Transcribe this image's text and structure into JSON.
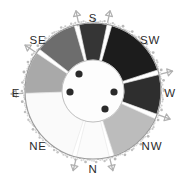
{
  "figure": {
    "background_color": "#ffffff",
    "center": {
      "x": 93,
      "y": 91
    },
    "outer_radius": 68,
    "ring_inner_radius": 31,
    "hub_radius": 31,
    "hub_color": "#fdfdfd",
    "hub_stroke": "#b9b9b9",
    "outline_color": "#9a9a9a",
    "stipple_color": "#a9a9a9",
    "arrow_color": "#b0b0b0"
  },
  "labels": [
    {
      "name": "S",
      "text": "S",
      "x": 93,
      "y": 19,
      "angle_deg": 90
    },
    {
      "name": "SE",
      "text": "SE",
      "x": 38,
      "y": 41,
      "angle_deg": 135
    },
    {
      "name": "SW",
      "text": "SW",
      "x": 150,
      "y": 41,
      "angle_deg": 45
    },
    {
      "name": "E",
      "text": "E",
      "x": 16,
      "y": 94,
      "angle_deg": 180
    },
    {
      "name": "W",
      "text": "W",
      "x": 170,
      "y": 94,
      "angle_deg": 0
    },
    {
      "name": "NE",
      "text": "NE",
      "x": 38,
      "y": 147,
      "angle_deg": 225
    },
    {
      "name": "NW",
      "text": "NW",
      "x": 152,
      "y": 147,
      "angle_deg": 315
    },
    {
      "name": "N",
      "text": "N",
      "x": 93,
      "y": 170,
      "angle_deg": 270
    }
  ],
  "chart_data": {
    "type": "pie",
    "xlabel": "",
    "ylabel": "",
    "legend": "none",
    "grid": false,
    "note": "Eight equal-angle sectors of an annulus, each shaded a distinct gray level and labelled with a compass direction.",
    "categories": [
      "S",
      "SW",
      "W",
      "NW",
      "N",
      "NE",
      "E",
      "SE"
    ],
    "values": [
      12.5,
      12.5,
      12.5,
      12.5,
      12.5,
      12.5,
      12.5,
      12.5
    ],
    "sectors": [
      {
        "label": "S",
        "start_deg": 78,
        "end_deg": 102,
        "fill": "#353535",
        "sweep_deg": 24
      },
      {
        "label": "SW",
        "start_deg": 18,
        "end_deg": 74,
        "fill": "#1e1e1e",
        "sweep_deg": 56
      },
      {
        "label": "W",
        "start_deg": -20,
        "end_deg": 14,
        "fill": "#2e2e2e",
        "sweep_deg": 34
      },
      {
        "label": "NW",
        "start_deg": -72,
        "end_deg": -24,
        "fill": "#bcbcbc",
        "sweep_deg": 48
      },
      {
        "label": "N",
        "start_deg": -104,
        "end_deg": -76,
        "fill": "#fbfbfb",
        "sweep_deg": 28
      },
      {
        "label": "NE",
        "start_deg": -178,
        "end_deg": -108,
        "fill": "#fafafa",
        "sweep_deg": 70
      },
      {
        "label": "E",
        "start_deg": 146,
        "end_deg": 182,
        "fill": "#a9a9a9",
        "sweep_deg": 36
      },
      {
        "label": "SE",
        "start_deg": 106,
        "end_deg": 142,
        "fill": "#6d6d6d",
        "sweep_deg": 36
      }
    ],
    "hub_markers": [
      {
        "name": "marker-1",
        "x": 79,
        "y": 74,
        "r": 3.6,
        "color": "#2a2a2a"
      },
      {
        "name": "marker-2",
        "x": 70,
        "y": 92,
        "r": 3.6,
        "color": "#2a2a2a"
      },
      {
        "name": "marker-3",
        "x": 114,
        "y": 92,
        "r": 3.6,
        "color": "#2a2a2a"
      },
      {
        "name": "marker-4",
        "x": 105,
        "y": 109,
        "r": 3.6,
        "color": "#2a2a2a"
      }
    ],
    "boundary_arrows": [
      {
        "name": "arrow-s-left",
        "angle_deg": 102
      },
      {
        "name": "arrow-s-right",
        "angle_deg": 78
      },
      {
        "name": "arrow-w-upper",
        "angle_deg": 14
      },
      {
        "name": "arrow-w-lower",
        "angle_deg": -20
      },
      {
        "name": "arrow-n-right",
        "angle_deg": -76
      },
      {
        "name": "arrow-n-left",
        "angle_deg": -104
      },
      {
        "name": "arrow-e-lower",
        "angle_deg": 182
      },
      {
        "name": "arrow-e-upper",
        "angle_deg": 146
      }
    ]
  }
}
